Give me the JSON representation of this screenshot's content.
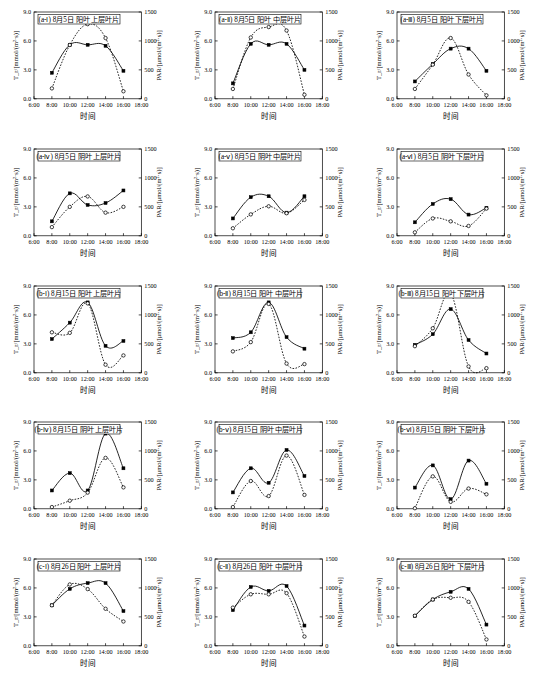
{
  "figure": {
    "grid_rows": 5,
    "grid_cols": 3,
    "xlabel": "时间",
    "ylabel_left": "T_r/[mmol/(m²·s)]",
    "ylabel_right": "PAR/[μmol/(m²·s)]",
    "x_ticklabels": [
      "6:00",
      "8:00",
      "10:00",
      "12:00",
      "14:00",
      "16:00",
      "18:00"
    ],
    "y_left_ticklabels": [
      "0.0",
      "3.0",
      "6.0",
      "9.0"
    ],
    "y_right_ticklabels": [
      "0",
      "500",
      "1000",
      "1500"
    ],
    "line_color": "#000000"
  },
  "chart_data": [
    {
      "type": "line",
      "title": "(a-ⅰ) 8月5日 阳叶 上层叶片",
      "xlabel": "时间",
      "ylabel": "T_r/[mmol/(m²·s)]",
      "ylabel2": "PAR/[μmol/(m²·s)]",
      "x": [
        "8:00",
        "10:00",
        "12:00",
        "14:00",
        "16:00"
      ],
      "xlim": [
        6,
        18
      ],
      "ylim": [
        0.0,
        9.0
      ],
      "ylim2": [
        0,
        1500
      ],
      "grid": false,
      "series": [
        {
          "name": "T_r",
          "marker": "filled-square",
          "style": "solid",
          "values": [
            2.7,
            5.6,
            5.6,
            5.5,
            2.9
          ]
        },
        {
          "name": "PAR",
          "marker": "open-circle",
          "style": "dotted",
          "values": [
            180,
            930,
            1290,
            1050,
            130
          ]
        }
      ]
    },
    {
      "type": "line",
      "title": "(a-ⅱ) 8月5日 阳叶 中层叶片",
      "xlabel": "时间",
      "ylabel": "T_r/[mmol/(m²·s)]",
      "ylabel2": "PAR/[μmol/(m²·s)]",
      "x": [
        "8:00",
        "10:00",
        "12:00",
        "14:00",
        "16:00"
      ],
      "xlim": [
        6,
        18
      ],
      "ylim": [
        0.0,
        9.0
      ],
      "ylim2": [
        0,
        1500
      ],
      "grid": false,
      "series": [
        {
          "name": "T_r",
          "marker": "filled-square",
          "style": "solid",
          "values": [
            1.6,
            5.7,
            5.6,
            5.7,
            3.0
          ]
        },
        {
          "name": "PAR",
          "marker": "open-circle",
          "style": "dotted",
          "values": [
            170,
            1060,
            1240,
            1180,
            70
          ]
        }
      ]
    },
    {
      "type": "line",
      "title": "(a-ⅲ) 8月5日 阳叶 下层叶片",
      "xlabel": "时间",
      "ylabel": "T_r/[mmol/(m²·s)]",
      "ylabel2": "PAR/[μmol/(m²·s)]",
      "x": [
        "8:00",
        "10:00",
        "12:00",
        "14:00",
        "16:00"
      ],
      "xlim": [
        6,
        18
      ],
      "ylim": [
        0.0,
        9.0
      ],
      "ylim2": [
        0,
        1500
      ],
      "grid": false,
      "series": [
        {
          "name": "T_r",
          "marker": "filled-square",
          "style": "solid",
          "values": [
            1.8,
            3.6,
            5.2,
            5.2,
            2.9
          ]
        },
        {
          "name": "PAR",
          "marker": "open-circle",
          "style": "dotted",
          "values": [
            170,
            590,
            1050,
            420,
            60
          ]
        }
      ]
    },
    {
      "type": "line",
      "title": "(a-ⅳ) 8月5日 阴叶 上层叶片",
      "xlabel": "时间",
      "ylabel": "T_r/[mmol/(m²·s)]",
      "ylabel2": "PAR/[μmol/(m²·s)]",
      "x": [
        "8:00",
        "10:00",
        "12:00",
        "14:00",
        "16:00"
      ],
      "xlim": [
        6,
        18
      ],
      "ylim": [
        0.0,
        9.0
      ],
      "ylim2": [
        0,
        1500
      ],
      "grid": false,
      "series": [
        {
          "name": "T_r",
          "marker": "filled-square",
          "style": "solid",
          "values": [
            1.5,
            4.4,
            3.2,
            3.4,
            4.7
          ]
        },
        {
          "name": "PAR",
          "marker": "open-circle",
          "style": "dotted",
          "values": [
            150,
            500,
            680,
            400,
            500
          ]
        }
      ]
    },
    {
      "type": "line",
      "title": "(a-ⅴ) 8月5日 阴叶 中层叶片",
      "xlabel": "时间",
      "ylabel": "T_r/[mmol/(m²·s)]",
      "ylabel2": "PAR/[μmol/(m²·s)]",
      "x": [
        "8:00",
        "10:00",
        "12:00",
        "14:00",
        "16:00"
      ],
      "xlim": [
        6,
        18
      ],
      "ylim": [
        0.0,
        9.0
      ],
      "ylim2": [
        0,
        1500
      ],
      "grid": false,
      "series": [
        {
          "name": "T_r",
          "marker": "filled-square",
          "style": "solid",
          "values": [
            1.8,
            4.0,
            4.1,
            2.4,
            4.1
          ]
        },
        {
          "name": "PAR",
          "marker": "open-circle",
          "style": "dotted",
          "values": [
            130,
            370,
            510,
            390,
            620
          ]
        }
      ]
    },
    {
      "type": "line",
      "title": "(a-ⅵ) 8月5日 阴叶 下层叶片",
      "xlabel": "时间",
      "ylabel": "T_r/[mmol/(m²·s)]",
      "ylabel2": "PAR/[μmol/(m²·s)]",
      "x": [
        "8:00",
        "10:00",
        "12:00",
        "14:00",
        "16:00"
      ],
      "xlim": [
        6,
        18
      ],
      "ylim": [
        0.0,
        9.0
      ],
      "ylim2": [
        0,
        1500
      ],
      "grid": false,
      "series": [
        {
          "name": "T_r",
          "marker": "filled-square",
          "style": "solid",
          "values": [
            1.4,
            3.3,
            3.8,
            2.2,
            2.9
          ]
        },
        {
          "name": "PAR",
          "marker": "open-circle",
          "style": "dotted",
          "values": [
            60,
            300,
            250,
            170,
            470
          ]
        }
      ]
    },
    {
      "type": "line",
      "title": "(b-ⅰ) 8月15日 阳叶 上层叶片",
      "xlabel": "时间",
      "ylabel": "T_r/[mmol/(m²·s)]",
      "ylabel2": "PAR/[μmol/(m²·s)]",
      "x": [
        "8:00",
        "10:00",
        "12:00",
        "14:00",
        "16:00"
      ],
      "xlim": [
        6,
        18
      ],
      "ylim": [
        0.0,
        9.0
      ],
      "ylim2": [
        0,
        1500
      ],
      "grid": false,
      "series": [
        {
          "name": "T_r",
          "marker": "filled-square",
          "style": "solid",
          "values": [
            3.5,
            5.2,
            7.3,
            2.8,
            3.3
          ]
        },
        {
          "name": "PAR",
          "marker": "open-circle",
          "style": "dotted",
          "values": [
            700,
            690,
            1200,
            140,
            300
          ]
        }
      ]
    },
    {
      "type": "line",
      "title": "(b-ⅱ) 8月15日 阳叶 中层叶片",
      "xlabel": "时间",
      "ylabel": "T_r/[mmol/(m²·s)]",
      "ylabel2": "PAR/[μmol/(m²·s)]",
      "x": [
        "8:00",
        "10:00",
        "12:00",
        "14:00",
        "16:00"
      ],
      "xlim": [
        6,
        18
      ],
      "ylim": [
        0.0,
        9.0
      ],
      "ylim2": [
        0,
        1500
      ],
      "grid": false,
      "series": [
        {
          "name": "T_r",
          "marker": "filled-square",
          "style": "solid",
          "values": [
            3.6,
            4.2,
            7.3,
            3.7,
            2.5
          ]
        },
        {
          "name": "PAR",
          "marker": "open-circle",
          "style": "dotted",
          "values": [
            370,
            530,
            1190,
            160,
            150
          ]
        }
      ]
    },
    {
      "type": "line",
      "title": "(b-ⅲ) 8月15日 阳叶 下层叶片",
      "xlabel": "时间",
      "ylabel": "T_r/[mmol/(m²·s)]",
      "ylabel2": "PAR/[μmol/(m²·s)]",
      "x": [
        "8:00",
        "10:00",
        "12:00",
        "14:00",
        "16:00"
      ],
      "xlim": [
        6,
        18
      ],
      "ylim": [
        0.0,
        9.0
      ],
      "ylim2": [
        0,
        1500
      ],
      "grid": false,
      "series": [
        {
          "name": "T_r",
          "marker": "filled-square",
          "style": "solid",
          "values": [
            2.9,
            4.0,
            6.6,
            3.4,
            2.0
          ]
        },
        {
          "name": "PAR",
          "marker": "open-circle",
          "style": "dotted",
          "values": [
            460,
            770,
            1370,
            110,
            80
          ]
        }
      ]
    },
    {
      "type": "line",
      "title": "(b-ⅳ) 8月15日 阴叶 上层叶片",
      "xlabel": "时间",
      "ylabel": "T_r/[mmol/(m²·s)]",
      "ylabel2": "PAR/[μmol/(m²·s)]",
      "x": [
        "8:00",
        "10:00",
        "12:00",
        "14:00",
        "16:00"
      ],
      "xlim": [
        6,
        18
      ],
      "ylim": [
        0.0,
        9.0
      ],
      "ylim2": [
        0,
        1500
      ],
      "grid": false,
      "series": [
        {
          "name": "T_r",
          "marker": "filled-square",
          "style": "solid",
          "values": [
            1.9,
            3.7,
            1.9,
            7.8,
            4.2
          ]
        },
        {
          "name": "PAR",
          "marker": "open-circle",
          "style": "dotted",
          "values": [
            30,
            140,
            280,
            880,
            370
          ]
        }
      ]
    },
    {
      "type": "line",
      "title": "(b-ⅴ) 8月15日 阴叶 中层叶片",
      "xlabel": "时间",
      "ylabel": "T_r/[mmol/(m²·s)]",
      "ylabel2": "PAR/[μmol/(m²·s)]",
      "x": [
        "8:00",
        "10:00",
        "12:00",
        "14:00",
        "16:00"
      ],
      "xlim": [
        6,
        18
      ],
      "ylim": [
        0.0,
        9.0
      ],
      "ylim2": [
        0,
        1500
      ],
      "grid": false,
      "series": [
        {
          "name": "T_r",
          "marker": "filled-square",
          "style": "solid",
          "values": [
            1.7,
            4.2,
            2.7,
            6.1,
            3.4
          ]
        },
        {
          "name": "PAR",
          "marker": "open-circle",
          "style": "dotted",
          "values": [
            30,
            480,
            220,
            920,
            240
          ]
        }
      ]
    },
    {
      "type": "line",
      "title": "(b-ⅵ) 8月15日 阴叶 下层叶片",
      "xlabel": "时间",
      "ylabel": "T_r/[mmol/(m²·s)]",
      "ylabel2": "PAR/[μmol/(m²·s)]",
      "x": [
        "8:00",
        "10:00",
        "12:00",
        "14:00",
        "16:00"
      ],
      "xlim": [
        6,
        18
      ],
      "ylim": [
        0.0,
        9.0
      ],
      "ylim2": [
        0,
        1500
      ],
      "grid": false,
      "series": [
        {
          "name": "T_r",
          "marker": "filled-square",
          "style": "solid",
          "values": [
            2.2,
            4.5,
            1.0,
            5.0,
            2.6
          ]
        },
        {
          "name": "PAR",
          "marker": "open-circle",
          "style": "dotted",
          "values": [
            10,
            560,
            120,
            350,
            250
          ]
        }
      ]
    },
    {
      "type": "line",
      "title": "(c-ⅰ) 8月26日 阳叶 上层叶片",
      "xlabel": "时间",
      "ylabel": "T_r/[mmol/(m²·s)]",
      "ylabel2": "PAR/[μmol/(m²·s)]",
      "x": [
        "8:00",
        "10:00",
        "12:00",
        "14:00",
        "16:00"
      ],
      "xlim": [
        6,
        18
      ],
      "ylim": [
        0.0,
        9.0
      ],
      "ylim2": [
        0,
        1500
      ],
      "grid": false,
      "series": [
        {
          "name": "T_r",
          "marker": "filled-square",
          "style": "solid",
          "values": [
            4.2,
            5.9,
            6.5,
            6.5,
            3.6
          ]
        },
        {
          "name": "PAR",
          "marker": "open-circle",
          "style": "dotted",
          "values": [
            700,
            1060,
            980,
            640,
            420
          ]
        }
      ]
    },
    {
      "type": "line",
      "title": "(c-ⅱ) 8月26日 阳叶 中层叶片",
      "xlabel": "时间",
      "ylabel": "T_r/[mmol/(m²·s)]",
      "ylabel2": "PAR/[μmol/(m²·s)]",
      "x": [
        "8:00",
        "10:00",
        "12:00",
        "14:00",
        "16:00"
      ],
      "xlim": [
        6,
        18
      ],
      "ylim": [
        0.0,
        9.0
      ],
      "ylim2": [
        0,
        1500
      ],
      "grid": false,
      "series": [
        {
          "name": "T_r",
          "marker": "filled-square",
          "style": "solid",
          "values": [
            3.7,
            6.1,
            5.7,
            6.2,
            2.1
          ]
        },
        {
          "name": "PAR",
          "marker": "open-circle",
          "style": "dotted",
          "values": [
            660,
            890,
            890,
            910,
            160
          ]
        }
      ]
    },
    {
      "type": "line",
      "title": "(c-ⅲ) 8月26日 阳叶 下层叶片",
      "xlabel": "时间",
      "ylabel": "T_r/[mmol/(m²·s)]",
      "ylabel2": "PAR/[μmol/(m²·s)]",
      "x": [
        "8:00",
        "10:00",
        "12:00",
        "14:00",
        "16:00"
      ],
      "xlim": [
        6,
        18
      ],
      "ylim": [
        0.0,
        9.0
      ],
      "ylim2": [
        0,
        1500
      ],
      "grid": false,
      "series": [
        {
          "name": "T_r",
          "marker": "filled-square",
          "style": "solid",
          "values": [
            3.1,
            4.8,
            5.6,
            5.9,
            2.2
          ]
        },
        {
          "name": "PAR",
          "marker": "open-circle",
          "style": "dotted",
          "values": [
            520,
            800,
            830,
            760,
            110
          ]
        }
      ]
    }
  ]
}
